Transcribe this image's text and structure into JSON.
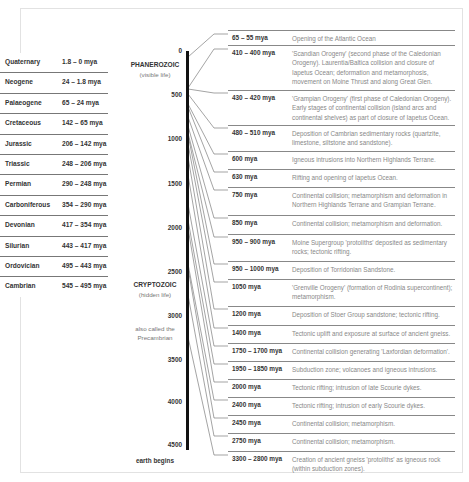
{
  "periods": [
    {
      "name": "Quaternary",
      "range": "1.8 – 0 mya"
    },
    {
      "name": "Neogene",
      "range": "24 – 1.8 mya"
    },
    {
      "name": "Palaeogene",
      "range": "65 – 24 mya"
    },
    {
      "name": "Cretaceous",
      "range": "142 – 65 mya"
    },
    {
      "name": "Jurassic",
      "range": "206 – 142 mya"
    },
    {
      "name": "Triassic",
      "range": "248 – 206 mya"
    },
    {
      "name": "Permian",
      "range": "290 – 248 mya"
    },
    {
      "name": "Carboniferous",
      "range": "354 – 290 mya"
    },
    {
      "name": "Devonian",
      "range": "417 – 354 mya"
    },
    {
      "name": "Silurian",
      "range": "443 – 417 mya"
    },
    {
      "name": "Ordovician",
      "range": "495 – 443 mya"
    },
    {
      "name": "Cambrian",
      "range": "545 – 495 mya"
    }
  ],
  "timeline": {
    "ticks": [
      "0",
      "500",
      "1000",
      "1500",
      "2000",
      "2500",
      "3000",
      "3500",
      "4000",
      "4500"
    ],
    "phanerozoic": {
      "title": "PHANEROZOIC",
      "subtitle": "(visible life)"
    },
    "cryptozoic": {
      "title": "CRYPTOZOIC",
      "subtitle": "(hidden life)"
    },
    "precambrian_note": "also called the Precambrian",
    "end_label": "earth begins"
  },
  "events": [
    {
      "date": "65 – 55 mya",
      "desc": "Opening of the Atlantic Ocean"
    },
    {
      "date": "410 – 400 mya",
      "desc": "'Scandian Orogeny' (second phase of the Caledonian Orogeny). Laurentia/Baltica collision and closure of Iapetus Ocean; deformation and metamorphosis, movement on Moine Thrust and along Great Glen."
    },
    {
      "date": "430 – 420 mya",
      "desc": "'Grampian Orogeny' (first phase of Caledonian Orogeny). Early stages of continental collision (island arcs and continental shelves) as part of closure of Iapetus Ocean."
    },
    {
      "date": "480 – 510 mya",
      "desc": "Deposition of Cambrian sedimentary rocks (quartzite, limestone, siltstone and sandstone)."
    },
    {
      "date": "600 mya",
      "desc": "Igneous intrusions into Northern Highlands Terrane."
    },
    {
      "date": "630 mya",
      "desc": "Rifting and opening of Iapetus Ocean."
    },
    {
      "date": "750 mya",
      "desc": "Continental collision; metamorphism and deformation in Northern Highlands Terrane and Grampian Terrane."
    },
    {
      "date": "850 mya",
      "desc": "Continental collision; metamorphism and deformation."
    },
    {
      "date": "950 – 900 mya",
      "desc": "Moine Supergroup 'protoliths' deposited as sedimentary rocks; tectonic rifting."
    },
    {
      "date": "950 – 1000 mya",
      "desc": "Deposition of Torridonian Sandstone."
    },
    {
      "date": "1050 mya",
      "desc": "'Grenville Orogeny' (formation of Rodinia supercontinent); metamorphism."
    },
    {
      "date": "1200 mya",
      "desc": "Deposition of Stoer Group sandstone; tectonic rifting."
    },
    {
      "date": "1400 mya",
      "desc": "Tectonic uplift and exposure at surface of ancient gneiss."
    },
    {
      "date": "1750 – 1700 mya",
      "desc": "Continental collision generating 'Laxfordian deformation'."
    },
    {
      "date": "1950 – 1850 mya",
      "desc": "Subduction zone; volcanoes and igneous intrusions."
    },
    {
      "date": "2000 mya",
      "desc": "Tectonic rifting; intrusion of late Scourie dykes."
    },
    {
      "date": "2400 mya",
      "desc": "Tectonic rifting; intrusion of early Scourie dykes."
    },
    {
      "date": "2450 mya",
      "desc": "Continental collision; metamorphism."
    },
    {
      "date": "2750 mya",
      "desc": "Continental collision; metamorphism."
    },
    {
      "date": "3300 – 2800 mya",
      "desc": "Creation of ancient gneiss 'protoliths' as igneous rock (within subduction zones)."
    }
  ]
}
